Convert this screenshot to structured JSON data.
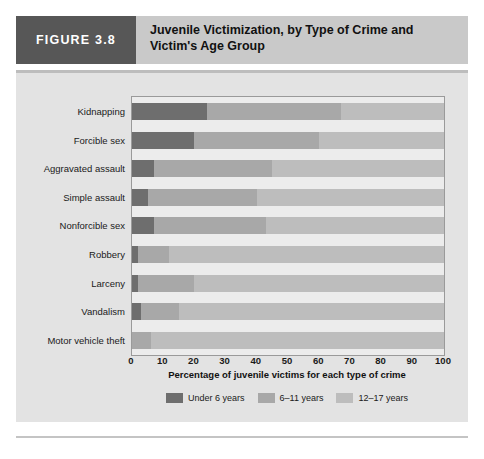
{
  "header": {
    "figure_tag": "FIGURE 3.8",
    "title": "Juvenile Victimization, by Type of Crime and Victim's Age Group"
  },
  "colors": {
    "under6": "#6e6e6e",
    "age6_11": "#a8a8a8",
    "age12_17": "#bdbdbd",
    "tag_background": "#575757",
    "header_background": "#c9c9c9",
    "panel_background": "#e3e3e3",
    "plot_background": "#ececec"
  },
  "legend": {
    "items": [
      {
        "label": "Under 6 years",
        "color": "#6e6e6e"
      },
      {
        "label": "6–11 years",
        "color": "#a8a8a8"
      },
      {
        "label": "12–17 years",
        "color": "#bdbdbd"
      }
    ]
  },
  "chart_data": {
    "type": "bar",
    "orientation": "horizontal",
    "stacked": true,
    "stack_total": 100,
    "title": "Juvenile Victimization, by Type of Crime and Victim's Age Group",
    "xlabel": "Percentage of juvenile victims for each type of crime",
    "ylabel": "",
    "xlim": [
      0,
      100
    ],
    "xticks": [
      0,
      10,
      20,
      30,
      40,
      50,
      60,
      70,
      80,
      90,
      100
    ],
    "grid": false,
    "legend_position": "bottom",
    "categories": [
      "Kidnapping",
      "Forcible sex",
      "Aggravated assault",
      "Simple assault",
      "Nonforcible sex",
      "Robbery",
      "Larceny",
      "Vandalism",
      "Motor vehicle theft"
    ],
    "series": [
      {
        "name": "Under 6 years",
        "color": "#6e6e6e",
        "values": [
          24,
          20,
          7,
          5,
          7,
          2,
          2,
          3,
          0
        ]
      },
      {
        "name": "6–11 years",
        "color": "#a8a8a8",
        "values": [
          43,
          40,
          38,
          35,
          36,
          10,
          18,
          12,
          6
        ]
      },
      {
        "name": "12–17 years",
        "color": "#bdbdbd",
        "values": [
          33,
          40,
          55,
          60,
          57,
          88,
          80,
          85,
          94
        ]
      }
    ]
  }
}
